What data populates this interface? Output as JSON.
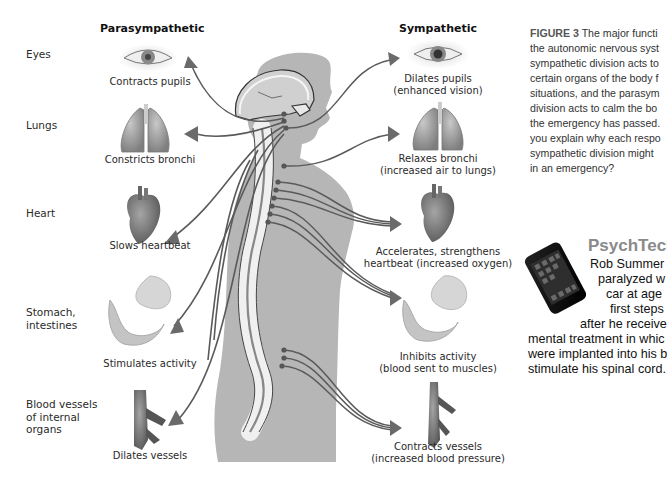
{
  "diagram": {
    "columns": {
      "parasympathetic": "Parasympathetic",
      "sympathetic": "Sympathetic"
    },
    "organs": [
      {
        "name": "Eyes",
        "parasympathetic": [
          "Contracts pupils"
        ],
        "sympathetic": [
          "Dilates pupils",
          "(enhanced vision)"
        ],
        "icon": "eye-icon"
      },
      {
        "name": "Lungs",
        "parasympathetic": [
          "Constricts bronchi"
        ],
        "sympathetic": [
          "Relaxes bronchi",
          "(increased air to lungs)"
        ],
        "icon": "lungs-icon"
      },
      {
        "name": "Heart",
        "parasympathetic": [
          "Slows heartbeat"
        ],
        "sympathetic": [
          "Accelerates, strengthens",
          "heartbeat (increased oxygen)"
        ],
        "icon": "heart-icon"
      },
      {
        "name_lines": [
          "Stomach,",
          "intestines"
        ],
        "parasympathetic": [
          "Stimulates activity"
        ],
        "sympathetic": [
          "Inhibits activity",
          "(blood sent to muscles)"
        ],
        "icon": "stomach-intestines-icon"
      },
      {
        "name_lines": [
          "Blood vessels",
          "of internal",
          "organs"
        ],
        "parasympathetic": [
          "Dilates vessels"
        ],
        "sympathetic": [
          "Contracts vessels",
          "(increased blood pressure)"
        ],
        "icon": "blood-vessel-icon"
      }
    ]
  },
  "caption": {
    "label": "FIGURE 3",
    "lines": [
      "The major functi",
      "the autonomic nervous syst",
      "sympathetic division acts to",
      "certain organs of the body f",
      "situations, and the parasym",
      "division acts to calm the bo",
      "the emergency has passed.",
      "you explain why each respo",
      "sympathetic division might",
      "in an emergency?"
    ]
  },
  "psychtech": {
    "title": "PsychTech",
    "icon": "smartphone-icon",
    "lines": [
      "Rob Summer",
      "paralyzed w",
      "car at age",
      "first steps",
      "after he receive",
      "mental treatment in whic",
      "were implanted into his b",
      "stimulate his spinal cord."
    ]
  },
  "colors": {
    "body_silhouette": "#b4b4b4",
    "nerve": "#5a5a5a",
    "organ_gray": "#9a9a9a",
    "psychtech_title": "#8a8a8a"
  }
}
